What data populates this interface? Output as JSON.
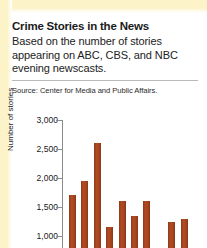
{
  "headline": "Crime Stories in the News",
  "subtitle": "Based on the number of stories appearing on ABC, CBS, and NBC evening newscasts.",
  "source": "Source: Center for Media and Public Affairs.",
  "colors": {
    "bar": "#a8441f",
    "page_edge": "#fdf3c8",
    "rule": "#b9b9b9",
    "axis": "#8c8c8c",
    "text": "#1b1b1b"
  },
  "chart_data": {
    "type": "bar",
    "title": "Crime Stories in the News",
    "subtitle": "Based on the number of stories appearing on ABC, CBS, and NBC evening newscasts.",
    "source": "Source: Center for Media and Public Affairs.",
    "xlabel": "",
    "ylabel": "Number of stories",
    "ylim": [
      0,
      3000
    ],
    "yticks": [
      3000,
      2500,
      2000,
      1500,
      1000
    ],
    "ytick_labels": [
      "3,000",
      "2,500",
      "2,000",
      "1,500",
      "1,000"
    ],
    "grid": false,
    "legend": "none",
    "note": "Chart is cropped at the bottom edge of the screenshot; bars continue below the visible area and x-axis category labels are not visible.",
    "categories": [
      "1",
      "2",
      "3",
      "4",
      "5",
      "6",
      "7",
      "8",
      "9",
      "10",
      "11"
    ],
    "values": [
      1700,
      1950,
      2600,
      1150,
      1600,
      1350,
      1600,
      500,
      1250,
      1300,
      700
    ],
    "series": [
      {
        "name": "Crime stories",
        "values": [
          1700,
          1950,
          2600,
          1150,
          1600,
          1350,
          1600,
          500,
          1250,
          1300,
          700
        ]
      }
    ]
  }
}
